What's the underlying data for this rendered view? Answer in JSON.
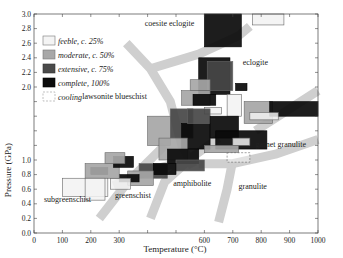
{
  "chart_data": {
    "type": "scatter",
    "title": "",
    "xlabel": "Temperature (°C)",
    "ylabel": "Pressure (GPa)",
    "xlim": [
      0,
      1000
    ],
    "ylim": [
      0,
      3.0
    ],
    "xticks": [
      0,
      100,
      200,
      300,
      600,
      700,
      800,
      900,
      1000
    ],
    "xticks_all": [
      0,
      100,
      200,
      300,
      400,
      500,
      600,
      700,
      800,
      900,
      1000
    ],
    "yticks": [
      "0.0",
      "0.2",
      "0.4",
      "0.6",
      "0.8",
      "1.0",
      "2.0",
      "2.2",
      "2.4",
      "2.6",
      "2.8",
      "3.0"
    ],
    "yticks_all": [
      0.0,
      0.2,
      0.4,
      0.6,
      0.8,
      1.0,
      1.2,
      1.4,
      1.6,
      1.8,
      2.0,
      2.2,
      2.4,
      2.6,
      2.8,
      3.0
    ],
    "grid": false,
    "legend_position": "upper-left",
    "legend": [
      {
        "label": "feeble, c. 25%",
        "fill": "#f4f4f4",
        "stroke": "#777",
        "dash": false
      },
      {
        "label": "moderate, c. 50%",
        "fill": "#a8a8a8",
        "stroke": "#777",
        "dash": false
      },
      {
        "label": "extensive, c. 75%",
        "fill": "#4a4a4a",
        "stroke": "#333",
        "dash": false
      },
      {
        "label": "complete, 100%",
        "fill": "#0c0c0c",
        "stroke": "#000",
        "dash": false
      },
      {
        "label": "cooling",
        "fill": "#ffffff",
        "stroke": "#999",
        "dash": true
      }
    ],
    "facies_labels": [
      {
        "text": "coesite eclogite",
        "T": 390,
        "P": 2.83
      },
      {
        "text": "eclogite",
        "T": 735,
        "P": 2.3
      },
      {
        "text": "lawsonite blueschist",
        "T": 170,
        "P": 1.83
      },
      {
        "text": "garnet granulite",
        "T": 780,
        "P": 1.18
      },
      {
        "text": "granulite",
        "T": 720,
        "P": 0.6
      },
      {
        "text": "amphibolite",
        "T": 490,
        "P": 0.65
      },
      {
        "text": "greenschist",
        "T": 285,
        "P": 0.48
      },
      {
        "text": "subgreenschist",
        "T": 35,
        "P": 0.42
      }
    ],
    "facies_boundaries": [
      {
        "name": "blueschist-greenschist",
        "points": [
          [
            325,
            2.6
          ],
          [
            410,
            2.25
          ],
          [
            480,
            1.8
          ],
          [
            520,
            1.2
          ],
          [
            560,
            0.9
          ]
        ]
      },
      {
        "name": "coesite-transition",
        "points": [
          [
            410,
            2.25
          ],
          [
            580,
            2.45
          ],
          [
            720,
            2.7
          ],
          [
            760,
            2.83
          ]
        ]
      },
      {
        "name": "subgreenschist-greenschist",
        "points": [
          [
            230,
            0.2
          ],
          [
            330,
            0.7
          ],
          [
            460,
            1.2
          ]
        ]
      },
      {
        "name": "greenschist-amphibolite",
        "points": [
          [
            410,
            0.2
          ],
          [
            460,
            0.7
          ],
          [
            560,
            1.05
          ],
          [
            650,
            1.3
          ]
        ]
      },
      {
        "name": "amphibolite-granulite",
        "points": [
          [
            650,
            0.15
          ],
          [
            680,
            0.6
          ],
          [
            700,
            1.0
          ]
        ]
      },
      {
        "name": "granulite-garnet-granulite",
        "points": [
          [
            580,
            0.95
          ],
          [
            700,
            0.95
          ],
          [
            850,
            1.08
          ],
          [
            1000,
            1.28
          ]
        ]
      },
      {
        "name": "eclogite-garnet-granulite",
        "points": [
          [
            780,
            1.4
          ],
          [
            900,
            1.7
          ],
          [
            1000,
            1.95
          ]
        ]
      },
      {
        "name": "greenschist-blueschist-lower",
        "points": [
          [
            280,
            0.65
          ],
          [
            340,
            0.75
          ],
          [
            400,
            0.85
          ],
          [
            500,
            0.95
          ]
        ]
      }
    ],
    "rectangles": [
      {
        "Tmin": 600,
        "Tmax": 730,
        "Pmin": 2.55,
        "Pmax": 3.0,
        "level": "complete"
      },
      {
        "Tmin": 770,
        "Tmax": 880,
        "Pmin": 2.85,
        "Pmax": 3.0,
        "level": "feeble"
      },
      {
        "Tmin": 580,
        "Tmax": 690,
        "Pmin": 1.9,
        "Pmax": 2.4,
        "level": "complete"
      },
      {
        "Tmin": 610,
        "Tmax": 700,
        "Pmin": 1.95,
        "Pmax": 2.35,
        "level": "extensive"
      },
      {
        "Tmin": 550,
        "Tmax": 620,
        "Pmin": 1.95,
        "Pmax": 2.1,
        "level": "moderate"
      },
      {
        "Tmin": 520,
        "Tmax": 620,
        "Pmin": 1.75,
        "Pmax": 1.95,
        "level": "moderate"
      },
      {
        "Tmin": 560,
        "Tmax": 640,
        "Pmin": 1.75,
        "Pmax": 1.9,
        "level": "complete"
      },
      {
        "Tmin": 600,
        "Tmax": 660,
        "Pmin": 1.63,
        "Pmax": 1.72,
        "level": "feeble"
      },
      {
        "Tmin": 710,
        "Tmax": 750,
        "Pmin": 1.95,
        "Pmax": 2.05,
        "level": "complete"
      },
      {
        "Tmin": 680,
        "Tmax": 730,
        "Pmin": 1.6,
        "Pmax": 1.9,
        "level": "feeble"
      },
      {
        "Tmin": 740,
        "Tmax": 840,
        "Pmin": 1.5,
        "Pmax": 1.8,
        "level": "moderate"
      },
      {
        "Tmin": 830,
        "Tmax": 1000,
        "Pmin": 1.6,
        "Pmax": 1.8,
        "level": "complete"
      },
      {
        "Tmin": 760,
        "Tmax": 860,
        "Pmin": 1.55,
        "Pmax": 1.65,
        "level": "feeble"
      },
      {
        "Tmin": 400,
        "Tmax": 480,
        "Pmin": 1.2,
        "Pmax": 1.6,
        "level": "moderate"
      },
      {
        "Tmin": 480,
        "Tmax": 560,
        "Pmin": 1.3,
        "Pmax": 1.7,
        "level": "extensive"
      },
      {
        "Tmin": 520,
        "Tmax": 620,
        "Pmin": 1.15,
        "Pmax": 1.5,
        "level": "complete"
      },
      {
        "Tmin": 540,
        "Tmax": 620,
        "Pmin": 1.5,
        "Pmax": 1.7,
        "level": "extensive"
      },
      {
        "Tmin": 620,
        "Tmax": 720,
        "Pmin": 1.3,
        "Pmax": 1.6,
        "level": "complete"
      },
      {
        "Tmin": 640,
        "Tmax": 820,
        "Pmin": 1.15,
        "Pmax": 1.4,
        "level": "complete"
      },
      {
        "Tmin": 700,
        "Tmax": 760,
        "Pmin": 1.2,
        "Pmax": 1.3,
        "level": "feeble"
      },
      {
        "Tmin": 600,
        "Tmax": 720,
        "Pmin": 1.1,
        "Pmax": 1.2,
        "level": "moderate"
      },
      {
        "Tmin": 680,
        "Tmax": 760,
        "Pmin": 0.97,
        "Pmax": 1.1,
        "level": "cooling"
      },
      {
        "Tmin": 440,
        "Tmax": 540,
        "Pmin": 1.0,
        "Pmax": 1.3,
        "level": "moderate"
      },
      {
        "Tmin": 470,
        "Tmax": 580,
        "Pmin": 0.95,
        "Pmax": 1.15,
        "level": "complete"
      },
      {
        "Tmin": 500,
        "Tmax": 600,
        "Pmin": 0.85,
        "Pmax": 1.0,
        "level": "extensive"
      },
      {
        "Tmin": 370,
        "Tmax": 470,
        "Pmin": 0.75,
        "Pmax": 0.95,
        "level": "extensive"
      },
      {
        "Tmin": 420,
        "Tmax": 500,
        "Pmin": 0.8,
        "Pmax": 0.95,
        "level": "complete"
      },
      {
        "Tmin": 330,
        "Tmax": 420,
        "Pmin": 0.65,
        "Pmax": 0.85,
        "level": "moderate"
      },
      {
        "Tmin": 300,
        "Tmax": 370,
        "Pmin": 0.7,
        "Pmax": 0.8,
        "level": "complete"
      },
      {
        "Tmin": 270,
        "Tmax": 340,
        "Pmin": 0.6,
        "Pmax": 0.75,
        "level": "feeble"
      },
      {
        "Tmin": 200,
        "Tmax": 260,
        "Pmin": 0.8,
        "Pmax": 0.9,
        "level": "complete"
      },
      {
        "Tmin": 180,
        "Tmax": 300,
        "Pmin": 0.75,
        "Pmax": 0.95,
        "level": "moderate"
      },
      {
        "Tmin": 280,
        "Tmax": 350,
        "Pmin": 0.9,
        "Pmax": 1.05,
        "level": "complete"
      },
      {
        "Tmin": 250,
        "Tmax": 320,
        "Pmin": 0.95,
        "Pmax": 1.1,
        "level": "moderate"
      },
      {
        "Tmin": 100,
        "Tmax": 260,
        "Pmin": 0.5,
        "Pmax": 0.75,
        "level": "feeble"
      },
      {
        "Tmin": 180,
        "Tmax": 250,
        "Pmin": 0.45,
        "Pmax": 0.75,
        "level": "feeble"
      }
    ]
  },
  "styles": {
    "facies_band_color": "#cfcfcf",
    "axis_color": "#444444",
    "level_fills": {
      "feeble": "#f2f2f2",
      "moderate": "#a6a6a6",
      "extensive": "#474747",
      "complete": "#0a0a0a",
      "cooling": "#ffffff"
    }
  }
}
